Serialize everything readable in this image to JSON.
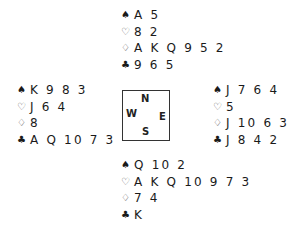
{
  "deal": {
    "north": {
      "spades": "A 5",
      "hearts": "8 2",
      "diamonds": "A K Q 9 5 2",
      "clubs": "9 6 5"
    },
    "west": {
      "spades": "K 9 8 3",
      "hearts": "J 6 4",
      "diamonds": "8",
      "clubs": "A Q 10 7 3"
    },
    "east": {
      "spades": "J 7 6 4",
      "hearts": "5",
      "diamonds": "J 10 6 3",
      "clubs": "J 8 4 2"
    },
    "south": {
      "spades": "Q 10 2",
      "hearts": "A K Q 10 9 7 3",
      "diamonds": "7 4",
      "clubs": "K"
    }
  },
  "suits": {
    "spades": "♠",
    "hearts": "♡",
    "diamonds": "♢",
    "clubs": "♣"
  },
  "compass": {
    "north": "N",
    "west": "W",
    "east": "E",
    "south": "S"
  }
}
